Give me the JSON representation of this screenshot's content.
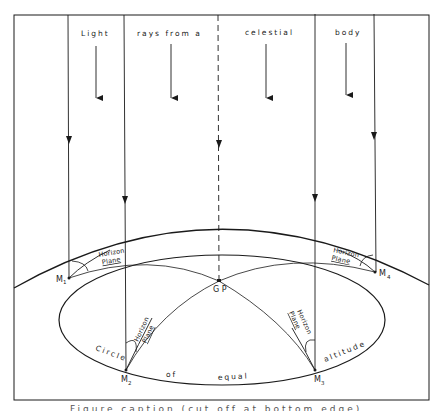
{
  "title_words": [
    "Light",
    "rays from a",
    "celestial",
    "body"
  ],
  "points": {
    "M1": {
      "main": "M",
      "sub": "1"
    },
    "M2": {
      "main": "M",
      "sub": "2"
    },
    "M3": {
      "main": "M",
      "sub": "3"
    },
    "M4": {
      "main": "M",
      "sub": "4"
    },
    "GP": "G P"
  },
  "horizon_plane": {
    "line1": "Horizon",
    "line2": "Plane"
  },
  "circle_label_words": [
    "Circle",
    "of",
    "equal",
    "altitude"
  ],
  "caption": "Figure caption (cut off at bottom edge)",
  "colors": {
    "line": "#1a1a1a",
    "background": "#ffffff"
  }
}
